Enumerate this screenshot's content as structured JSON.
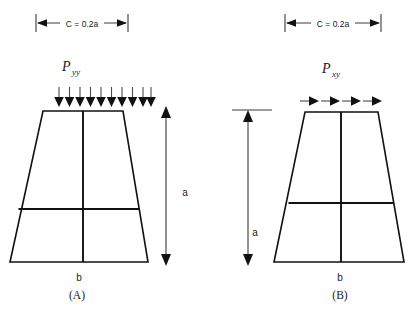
{
  "figure": {
    "title_present": false,
    "background_color": "#ffffff",
    "line_color": "#111111",
    "dimension_color": "#3a3a3a"
  },
  "panels": [
    {
      "id": "panel-a",
      "caption": "(A)",
      "load_label": "P",
      "load_subscript": "yy",
      "load_type": "normal-pressure",
      "dimension_top_label": "C = 0.2a",
      "height_label": "a",
      "base_label": "b",
      "arrow_count": 10,
      "arrow_direction": "down"
    },
    {
      "id": "panel-b",
      "caption": "(B)",
      "load_label": "P",
      "load_subscript": "xy",
      "load_type": "shear",
      "dimension_top_label": "C = 0.2a",
      "height_label": "a",
      "base_label": "b",
      "arrow_count": 4,
      "arrow_direction": "right"
    }
  ]
}
